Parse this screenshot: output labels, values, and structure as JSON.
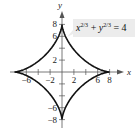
{
  "chart_data": {
    "type": "line",
    "title": "",
    "annotation": {
      "lhs_x": "x",
      "exp1": "2/3",
      "plus": " + ",
      "lhs_y": "y",
      "exp2": "2/3",
      "rhs": " = 4"
    },
    "equation": "x^(2/3) + y^(2/3) = 4",
    "xlabel": "x",
    "ylabel": "y",
    "xlim": [
      -9,
      9
    ],
    "ylim": [
      -9,
      9
    ],
    "x_ticks": [
      -6,
      -4,
      -2,
      2,
      4,
      6,
      8
    ],
    "x_tick_labels": [
      "−6",
      "−2",
      "2",
      "6",
      "8"
    ],
    "x_tick_label_values": [
      -6,
      -2,
      2,
      6,
      8
    ],
    "y_ticks": [
      -8,
      -6,
      -4,
      -2,
      2,
      4,
      6,
      8
    ],
    "y_tick_labels": [
      "8",
      "6",
      "2",
      "−6",
      "−8"
    ],
    "y_tick_label_values": [
      8,
      6,
      2,
      -6,
      -8
    ],
    "series": [
      {
        "name": "astroid",
        "curve": "x^(2/3) + y^(2/3) = 4",
        "parametric": "x = 8cos^3(t), y = 8sin^3(t)",
        "cusps": [
          [
            8,
            0
          ],
          [
            0,
            8
          ],
          [
            -8,
            0
          ],
          [
            0,
            -8
          ]
        ],
        "color": "#111111"
      }
    ],
    "grid": false
  }
}
